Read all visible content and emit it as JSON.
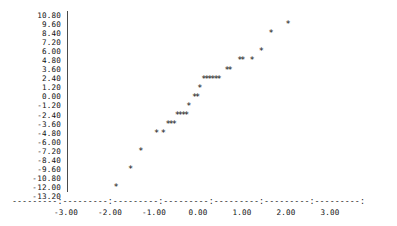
{
  "chart_data": {
    "type": "scatter",
    "title": "",
    "subtitle": "",
    "xlabel": "",
    "ylabel": "",
    "marker": "*",
    "grid": false,
    "legend": null,
    "xlim": [
      -3.0,
      3.0
    ],
    "ylim": [
      -13.2,
      10.8
    ],
    "x_ticks": [
      -3.0,
      -2.0,
      -1.0,
      0.0,
      1.0,
      2.0,
      3.0
    ],
    "x_tick_labels": [
      "-3.00",
      "-2.00",
      "-1.00",
      "0.00",
      "1.00",
      "2.00",
      "3.00"
    ],
    "y_ticks": [
      10.8,
      9.6,
      8.4,
      7.2,
      6.0,
      4.8,
      3.6,
      2.4,
      1.2,
      0.0,
      -1.2,
      -2.4,
      -3.6,
      -4.8,
      -6.0,
      -7.2,
      -8.4,
      -9.6,
      -10.8,
      -12.0,
      -13.2
    ],
    "y_tick_labels": [
      "10.80",
      "9.60",
      "8.40",
      "7.20",
      "6.00",
      "4.80",
      "3.60",
      "2.40",
      "1.20",
      "0.00",
      "-1.20",
      "-2.40",
      "-3.60",
      "-4.80",
      "-6.00",
      "-7.20",
      "-8.40",
      "-9.60",
      "-10.80",
      "-12.00",
      "-13.20"
    ],
    "axis_line_text": "---------:---------:---------:---------:---------:---------:---------:",
    "points": [
      {
        "x": -1.86,
        "y": -12.0
      },
      {
        "x": -1.53,
        "y": -9.6
      },
      {
        "x": -1.3,
        "y": -7.2
      },
      {
        "x": -0.94,
        "y": -4.8
      },
      {
        "x": -0.79,
        "y": -4.8
      },
      {
        "x": -0.68,
        "y": -3.6
      },
      {
        "x": -0.61,
        "y": -3.6
      },
      {
        "x": -0.54,
        "y": -3.6
      },
      {
        "x": -0.47,
        "y": -2.4
      },
      {
        "x": -0.4,
        "y": -2.4
      },
      {
        "x": -0.33,
        "y": -2.4
      },
      {
        "x": -0.26,
        "y": -2.4
      },
      {
        "x": -0.21,
        "y": -1.2
      },
      {
        "x": -0.08,
        "y": 0.0
      },
      {
        "x": -0.01,
        "y": 0.0
      },
      {
        "x": 0.04,
        "y": 1.2
      },
      {
        "x": 0.13,
        "y": 2.4
      },
      {
        "x": 0.2,
        "y": 2.4
      },
      {
        "x": 0.27,
        "y": 2.4
      },
      {
        "x": 0.34,
        "y": 2.4
      },
      {
        "x": 0.41,
        "y": 2.4
      },
      {
        "x": 0.48,
        "y": 2.4
      },
      {
        "x": 0.66,
        "y": 3.6
      },
      {
        "x": 0.73,
        "y": 3.6
      },
      {
        "x": 0.95,
        "y": 4.8
      },
      {
        "x": 1.02,
        "y": 4.8
      },
      {
        "x": 1.23,
        "y": 4.8
      },
      {
        "x": 1.44,
        "y": 6.0
      },
      {
        "x": 1.66,
        "y": 8.4
      },
      {
        "x": 2.05,
        "y": 9.6
      }
    ]
  }
}
